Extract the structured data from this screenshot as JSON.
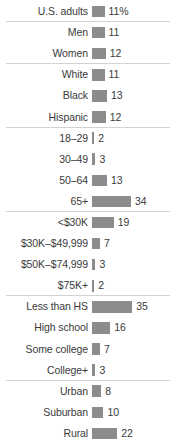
{
  "chart_data": {
    "type": "bar",
    "orientation": "horizontal",
    "title": "",
    "subtitle": "",
    "xlabel": "",
    "ylabel": "",
    "grid": false,
    "legend": null,
    "xlim": [
      0,
      35
    ],
    "value_suffix_first_row": "%",
    "bar_color": "#8c8c8c",
    "text_color": "#3a3a3a",
    "separator_color": "#d2d2d2",
    "categories": [
      "U.S. adults",
      "Men",
      "Women",
      "White",
      "Black",
      "Hispanic",
      "18–29",
      "30–49",
      "50–64",
      "65+",
      "<$30K",
      "$30K–$49,999",
      "$50K–$74,999",
      "$75K+",
      "Less than HS",
      "High school",
      "Some college",
      "College+",
      "Urban",
      "Suburban",
      "Rural"
    ],
    "values": [
      11,
      11,
      12,
      11,
      13,
      12,
      2,
      3,
      13,
      34,
      19,
      7,
      3,
      2,
      35,
      16,
      7,
      3,
      8,
      10,
      22
    ],
    "value_labels": [
      "11%",
      "11",
      "12",
      "11",
      "13",
      "12",
      "2",
      "3",
      "13",
      "34",
      "19",
      "7",
      "3",
      "2",
      "35",
      "16",
      "7",
      "3",
      "8",
      "10",
      "22"
    ],
    "groups": [
      {
        "name": "total",
        "rows": [
          0
        ]
      },
      {
        "name": "gender",
        "rows": [
          1,
          2
        ]
      },
      {
        "name": "race-ethnicity",
        "rows": [
          3,
          4,
          5
        ]
      },
      {
        "name": "age",
        "rows": [
          6,
          7,
          8,
          9
        ]
      },
      {
        "name": "income",
        "rows": [
          10,
          11,
          12,
          13
        ]
      },
      {
        "name": "education",
        "rows": [
          14,
          15,
          16,
          17
        ]
      },
      {
        "name": "community-type",
        "rows": [
          18,
          19,
          20
        ]
      }
    ]
  },
  "rows": [
    {
      "label": "U.S. adults",
      "value": 11,
      "display": "11%",
      "separator": true
    },
    {
      "label": "Men",
      "value": 11,
      "display": "11",
      "separator": false
    },
    {
      "label": "Women",
      "value": 12,
      "display": "12",
      "separator": true
    },
    {
      "label": "White",
      "value": 11,
      "display": "11",
      "separator": false
    },
    {
      "label": "Black",
      "value": 13,
      "display": "13",
      "separator": false
    },
    {
      "label": "Hispanic",
      "value": 12,
      "display": "12",
      "separator": true
    },
    {
      "label": "18–29",
      "value": 2,
      "display": "2",
      "separator": false
    },
    {
      "label": "30–49",
      "value": 3,
      "display": "3",
      "separator": false
    },
    {
      "label": "50–64",
      "value": 13,
      "display": "13",
      "separator": false
    },
    {
      "label": "65+",
      "value": 34,
      "display": "34",
      "separator": true
    },
    {
      "label": "<$30K",
      "value": 19,
      "display": "19",
      "separator": false
    },
    {
      "label": "$30K–$49,999",
      "value": 7,
      "display": "7",
      "separator": false
    },
    {
      "label": "$50K–$74,999",
      "value": 3,
      "display": "3",
      "separator": false
    },
    {
      "label": "$75K+",
      "value": 2,
      "display": "2",
      "separator": true
    },
    {
      "label": "Less than HS",
      "value": 35,
      "display": "35",
      "separator": false
    },
    {
      "label": "High school",
      "value": 16,
      "display": "16",
      "separator": false
    },
    {
      "label": "Some college",
      "value": 7,
      "display": "7",
      "separator": false
    },
    {
      "label": "College+",
      "value": 3,
      "display": "3",
      "separator": true
    },
    {
      "label": "Urban",
      "value": 8,
      "display": "8",
      "separator": false
    },
    {
      "label": "Suburban",
      "value": 10,
      "display": "10",
      "separator": false
    },
    {
      "label": "Rural",
      "value": 22,
      "display": "22",
      "separator": false
    }
  ]
}
